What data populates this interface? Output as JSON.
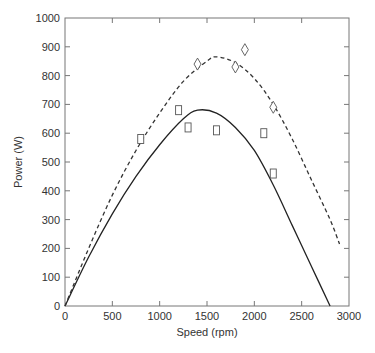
{
  "chart_data": {
    "type": "line",
    "title": "",
    "xlabel": "Speed (rpm)",
    "ylabel": "Power (W)",
    "xlim": [
      0,
      3000
    ],
    "ylim": [
      0,
      1000
    ],
    "xticks": [
      0,
      500,
      1000,
      1500,
      2000,
      2500,
      3000
    ],
    "yticks": [
      0,
      100,
      200,
      300,
      400,
      500,
      600,
      700,
      800,
      900,
      1000
    ],
    "grid": false,
    "legend": null,
    "series": [
      {
        "name": "fit-solid",
        "style": "solid",
        "x": [
          0,
          250,
          500,
          750,
          1000,
          1250,
          1400,
          1600,
          1800,
          2000,
          2200,
          2400,
          2600,
          2800
        ],
        "y": [
          0,
          170,
          320,
          450,
          560,
          650,
          680,
          670,
          620,
          540,
          420,
          280,
          140,
          0
        ]
      },
      {
        "name": "fit-dashed",
        "style": "dashed",
        "x": [
          0,
          250,
          500,
          750,
          1000,
          1250,
          1500,
          1600,
          1800,
          2000,
          2200,
          2400,
          2600,
          2800,
          2900
        ],
        "y": [
          0,
          200,
          385,
          540,
          670,
          780,
          850,
          865,
          845,
          790,
          700,
          580,
          440,
          300,
          215
        ]
      },
      {
        "name": "measured-squares",
        "style": "marker-square",
        "x": [
          800,
          1200,
          1300,
          1600,
          2100,
          2200
        ],
        "y": [
          580,
          680,
          620,
          610,
          600,
          460
        ]
      },
      {
        "name": "measured-diamonds",
        "style": "marker-diamond",
        "x": [
          1400,
          1800,
          1900,
          2200
        ],
        "y": [
          840,
          830,
          890,
          690
        ]
      }
    ]
  }
}
